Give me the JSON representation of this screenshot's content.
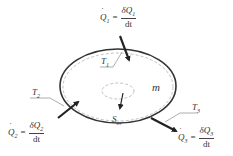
{
  "diagram": {
    "system_mass_label": "m",
    "entropy_generation_label": "S",
    "entropy_generation_sub": "irr",
    "boundary_temperatures": [
      {
        "name": "T",
        "sub": "1"
      },
      {
        "name": "T",
        "sub": "2"
      },
      {
        "name": "T",
        "sub": "3"
      }
    ],
    "heat_flows": [
      {
        "id": "Q1",
        "lhs": "Q",
        "lhs_sub": "1",
        "eq": "=",
        "num": "δQ",
        "num_sub": "1",
        "den": "dt",
        "direction": "in"
      },
      {
        "id": "Q2",
        "lhs": "Q",
        "lhs_sub": "2",
        "eq": "=",
        "num": "δQ",
        "num_sub": "2",
        "den": "dt",
        "direction": "in"
      },
      {
        "id": "Q3",
        "lhs": "Q",
        "lhs_sub": "3",
        "eq": "=",
        "num": "δQ",
        "num_sub": "3",
        "den": "dt",
        "direction": "out"
      }
    ],
    "colors": {
      "stroke": "#333333",
      "dashed": "#888888",
      "background": "#ffffff"
    }
  }
}
